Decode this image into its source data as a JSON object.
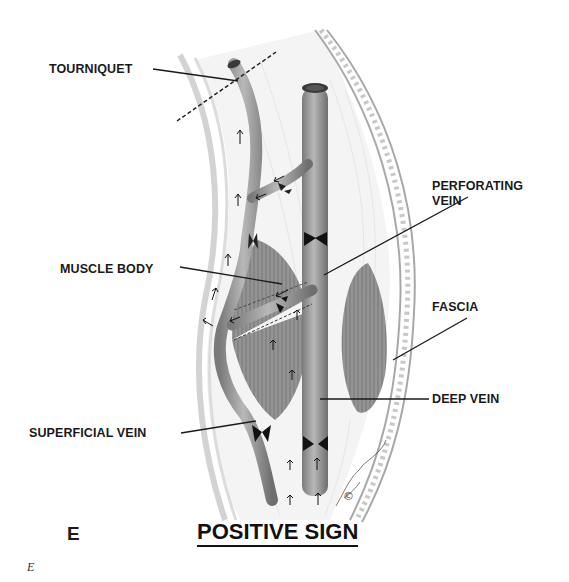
{
  "figure": {
    "panel_letter": "E",
    "title": "POSITIVE SIGN",
    "caption": "E",
    "copyright_mark": "©"
  },
  "labels": {
    "tourniquet": "TOURNIQUET",
    "perforating_vein_line1": "PERFORATING",
    "perforating_vein_line2": "VEIN",
    "muscle_body": "MUSCLE BODY",
    "fascia": "FASCIA",
    "deep_vein": "DEEP VEIN",
    "superficial_vein": "SUPERFICIAL VEIN"
  },
  "colors": {
    "vein_fill": "#8a8a8a",
    "vein_highlight": "#b5b5b5",
    "muscle_fill": "#7a7a7a",
    "fascia_stroke": "#999999",
    "label_text": "#1a1a1a"
  }
}
